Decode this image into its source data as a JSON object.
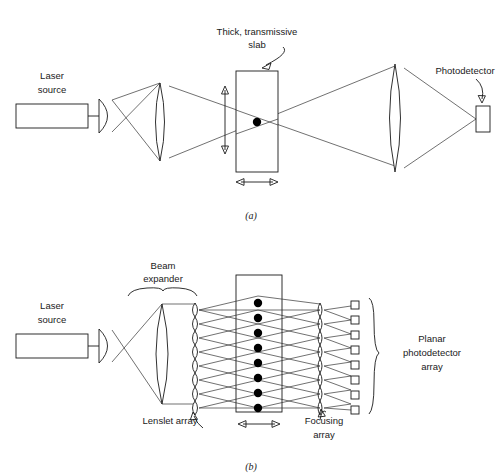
{
  "figure": {
    "background_color": "#ffffff",
    "ink_color": "#1a1a1a"
  },
  "panel_a": {
    "caption": "(a)",
    "labels": {
      "laser_source_line1": "Laser",
      "laser_source_line2": "source",
      "slab_line1": "Thick, transmissive",
      "slab_line2": "slab",
      "photodetector": "Photodetector"
    },
    "components": [
      {
        "name": "laser-source-box",
        "x": 16,
        "y": 104,
        "w": 72,
        "h": 24
      },
      {
        "name": "collimating-lens",
        "cx": 105,
        "cy": 116,
        "rx": 7,
        "ry": 17
      },
      {
        "name": "objective-lens",
        "cx": 160,
        "cy": 122,
        "rx": 9,
        "ry": 39
      },
      {
        "name": "thick-slab",
        "x": 236,
        "y": 71,
        "w": 42,
        "h": 101
      },
      {
        "name": "focal-dot",
        "cx": 257,
        "cy": 122,
        "r": 4.2
      },
      {
        "name": "collector-lens",
        "cx": 395,
        "cy": 118,
        "rx": 10,
        "ry": 54
      },
      {
        "name": "photodetector-box",
        "x": 476,
        "y": 106,
        "w": 14,
        "h": 26
      }
    ],
    "annotations": {
      "vertical_arrow": {
        "x": 225,
        "y_top": 88,
        "y_bottom": 152
      },
      "horizontal_arrow": {
        "y": 182,
        "x_left": 237,
        "x_right": 277
      }
    }
  },
  "panel_b": {
    "caption": "(b)",
    "labels": {
      "laser_source_line1": "Laser",
      "laser_source_line2": "source",
      "beam_expander_line1": "Beam",
      "beam_expander_line2": "expander",
      "lenslet_array": "Lenslet array",
      "focusing_array_line1": "Focusing",
      "focusing_array_line2": "array",
      "planar_array_line1": "Planar",
      "planar_array_line2": "photodetector",
      "planar_array_line3": "array"
    },
    "counts": {
      "lenslets": 8,
      "slab_dots": 8,
      "focusing_lenslets": 8,
      "detector_pixels": 8
    },
    "components": [
      {
        "name": "laser-source-box",
        "x": 16,
        "y": 334,
        "w": 72,
        "h": 24
      },
      {
        "name": "collimating-lens",
        "cx": 105,
        "cy": 346,
        "rx": 7,
        "ry": 17
      },
      {
        "name": "beam-expander-lens",
        "cx": 162,
        "cy": 354,
        "rx": 11,
        "ry": 50
      },
      {
        "name": "lenslet-array-column",
        "x": 195,
        "y_top": 302,
        "y_bottom": 410
      },
      {
        "name": "thick-slab",
        "x": 236,
        "y": 275,
        "w": 46,
        "h": 137
      },
      {
        "name": "focusing-array-column",
        "x": 320,
        "y_top": 302,
        "y_bottom": 410
      },
      {
        "name": "detector-pixel-column",
        "x": 351,
        "y_top": 302,
        "y_bottom": 410
      },
      {
        "name": "planar-array-brace",
        "x": 370,
        "y_top": 298,
        "y_bottom": 414
      }
    ],
    "annotations": {
      "horizontal_arrow": {
        "y": 424,
        "x_left": 238,
        "x_right": 280
      },
      "beam_expander_brace": {
        "x_left": 130,
        "x_right": 196,
        "y": 296
      }
    }
  },
  "icons": {
    "dot": "filled-circle-icon",
    "lens": "biconvex-lens-icon",
    "arrow": "double-headed-arrow-icon",
    "brace": "curly-brace-icon"
  }
}
